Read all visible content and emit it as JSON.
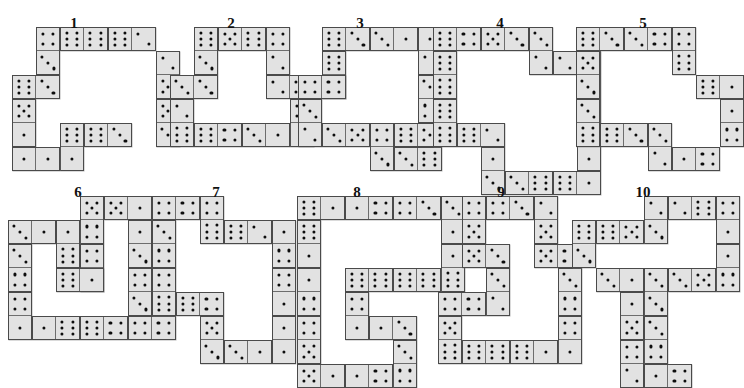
{
  "page": {
    "background_color": "#ffffff",
    "tile_color": "#e2e2e2",
    "tile_border_color": "#4a4a4a",
    "pip_color": "#0d0d0d",
    "label_color": "#111111"
  },
  "geometry": {
    "cell": 24,
    "tile_inset": 1,
    "note": "each domino occupies two adjacent grid cells of 24px"
  },
  "puzzles": [
    {
      "label": "1",
      "origin": [
        12,
        27
      ],
      "label_pos": [
        74,
        16
      ],
      "dominoes": [
        {
          "name": "d1",
          "col": 1,
          "row": 0,
          "orient": "v",
          "a": 4,
          "b": 3
        },
        {
          "name": "d2",
          "col": 2,
          "row": 0,
          "orient": "h",
          "a": 6,
          "b": 6
        },
        {
          "name": "d3",
          "col": 4,
          "row": 0,
          "orient": "h",
          "a": 6,
          "b": 2
        },
        {
          "name": "d4",
          "col": 6,
          "row": 1,
          "orient": "v",
          "a": 2,
          "b": 5
        },
        {
          "name": "d5",
          "col": 0,
          "row": 2,
          "orient": "h",
          "a": 6,
          "b": 3
        },
        {
          "name": "d6",
          "col": 0,
          "row": 3,
          "orient": "v",
          "a": 5,
          "b": 1
        },
        {
          "name": "d7",
          "col": 6,
          "row": 3,
          "orient": "v",
          "a": 5,
          "b": 3
        },
        {
          "name": "d8",
          "col": 2,
          "row": 4,
          "orient": "v",
          "a": 6,
          "b": 1
        },
        {
          "name": "d9",
          "col": 3,
          "row": 4,
          "orient": "h",
          "a": 6,
          "b": 3
        },
        {
          "name": "d10",
          "col": 0,
          "row": 5,
          "orient": "h",
          "a": 1,
          "b": 1
        }
      ]
    },
    {
      "label": "2",
      "origin": [
        170,
        27
      ],
      "label_pos": [
        231,
        16
      ],
      "dominoes": [
        {
          "name": "d1",
          "col": 1,
          "row": 0,
          "orient": "v",
          "a": 6,
          "b": 3
        },
        {
          "name": "d2",
          "col": 2,
          "row": 0,
          "orient": "h",
          "a": 5,
          "b": 6
        },
        {
          "name": "d3",
          "col": 4,
          "row": 0,
          "orient": "v",
          "a": 4,
          "b": 2
        },
        {
          "name": "d4",
          "col": 0,
          "row": 2,
          "orient": "h",
          "a": 3,
          "b": 3
        },
        {
          "name": "d5",
          "col": 4,
          "row": 2,
          "orient": "h",
          "a": 2,
          "b": 5
        },
        {
          "name": "d6",
          "col": 0,
          "row": 3,
          "orient": "v",
          "a": 2,
          "b": 6
        },
        {
          "name": "d7",
          "col": 5,
          "row": 3,
          "orient": "v",
          "a": 5,
          "b": 1
        },
        {
          "name": "d8",
          "col": 1,
          "row": 4,
          "orient": "h",
          "a": 6,
          "b": 4
        },
        {
          "name": "d9",
          "col": 3,
          "row": 4,
          "orient": "h",
          "a": 3,
          "b": 1
        }
      ]
    },
    {
      "label": "3",
      "origin": [
        298,
        27
      ],
      "label_pos": [
        360,
        16
      ],
      "dominoes": [
        {
          "name": "d1",
          "col": 1,
          "row": 0,
          "orient": "h",
          "a": 6,
          "b": 3
        },
        {
          "name": "d2",
          "col": 3,
          "row": 0,
          "orient": "h",
          "a": 3,
          "b": 1
        },
        {
          "name": "d3",
          "col": 5,
          "row": 0,
          "orient": "v",
          "a": 1,
          "b": 2
        },
        {
          "name": "d4",
          "col": 1,
          "row": 1,
          "orient": "v",
          "a": 6,
          "b": 4
        },
        {
          "name": "d5",
          "col": 0,
          "row": 2,
          "orient": "h",
          "a": 4,
          "b": 4
        },
        {
          "name": "d6",
          "col": 5,
          "row": 2,
          "orient": "v",
          "a": 3,
          "b": 4
        },
        {
          "name": "d7",
          "col": 0,
          "row": 3,
          "orient": "v",
          "a": 3,
          "b": 2
        },
        {
          "name": "d8",
          "col": 1,
          "row": 4,
          "orient": "h",
          "a": 3,
          "b": 5
        },
        {
          "name": "d9",
          "col": 3,
          "row": 4,
          "orient": "v",
          "a": 4,
          "b": 3
        },
        {
          "name": "d10",
          "col": 4,
          "row": 4,
          "orient": "h",
          "a": 6,
          "b": 5
        },
        {
          "name": "d11",
          "col": 4,
          "row": 5,
          "orient": "h",
          "a": 3,
          "b": 6
        }
      ]
    },
    {
      "label": "4",
      "origin": [
        433,
        27
      ],
      "label_pos": [
        500,
        16
      ],
      "dominoes": [
        {
          "name": "d1",
          "col": 0,
          "row": 0,
          "orient": "h",
          "a": 6,
          "b": 4
        },
        {
          "name": "d2",
          "col": 2,
          "row": 0,
          "orient": "h",
          "a": 5,
          "b": 3
        },
        {
          "name": "d3",
          "col": 4,
          "row": 0,
          "orient": "v",
          "a": 3,
          "b": 2
        },
        {
          "name": "d4",
          "col": 5,
          "row": 1,
          "orient": "h",
          "a": 2,
          "b": 5
        },
        {
          "name": "d5",
          "col": 0,
          "row": 1,
          "orient": "v",
          "a": 6,
          "b": 6
        },
        {
          "name": "d6",
          "col": 6,
          "row": 2,
          "orient": "v",
          "a": 4,
          "b": 1
        },
        {
          "name": "d7",
          "col": 0,
          "row": 3,
          "orient": "v",
          "a": 6,
          "b": 6
        },
        {
          "name": "d8",
          "col": 1,
          "row": 4,
          "orient": "h",
          "a": 6,
          "b": 2
        },
        {
          "name": "d9",
          "col": 6,
          "row": 4,
          "orient": "v",
          "a": 1,
          "b": 1
        },
        {
          "name": "d10",
          "col": 2,
          "row": 5,
          "orient": "v",
          "a": 1,
          "b": 3
        },
        {
          "name": "d11",
          "col": 3,
          "row": 6,
          "orient": "h",
          "a": 3,
          "b": 6
        },
        {
          "name": "d12",
          "col": 5,
          "row": 6,
          "orient": "h",
          "a": 6,
          "b": 1
        }
      ]
    },
    {
      "label": "5",
      "origin": [
        576,
        27
      ],
      "label_pos": [
        643,
        16
      ],
      "dominoes": [
        {
          "name": "d1",
          "col": 0,
          "row": 0,
          "orient": "h",
          "a": 6,
          "b": 3
        },
        {
          "name": "d2",
          "col": 2,
          "row": 0,
          "orient": "h",
          "a": 3,
          "b": 4
        },
        {
          "name": "d3",
          "col": 4,
          "row": 0,
          "orient": "v",
          "a": 4,
          "b": 6
        },
        {
          "name": "d4",
          "col": 0,
          "row": 1,
          "orient": "v",
          "a": 5,
          "b": 3
        },
        {
          "name": "d5",
          "col": 5,
          "row": 2,
          "orient": "h",
          "a": 6,
          "b": 1
        },
        {
          "name": "d6",
          "col": 0,
          "row": 3,
          "orient": "v",
          "a": 3,
          "b": 6
        },
        {
          "name": "d7",
          "col": 6,
          "row": 3,
          "orient": "v",
          "a": 1,
          "b": 4
        },
        {
          "name": "d8",
          "col": 1,
          "row": 4,
          "orient": "h",
          "a": 6,
          "b": 3
        },
        {
          "name": "d9",
          "col": 3,
          "row": 4,
          "orient": "v",
          "a": 3,
          "b": 2
        },
        {
          "name": "d10",
          "col": 4,
          "row": 5,
          "orient": "h",
          "a": 1,
          "b": 4
        }
      ]
    },
    {
      "label": "6",
      "origin": [
        8,
        196
      ],
      "label_pos": [
        78,
        185
      ],
      "dominoes": [
        {
          "name": "d1",
          "col": 3,
          "row": 0,
          "orient": "v",
          "a": 5,
          "b": 4
        },
        {
          "name": "d2",
          "col": 4,
          "row": 0,
          "orient": "h",
          "a": 5,
          "b": 1
        },
        {
          "name": "d3",
          "col": 0,
          "row": 1,
          "orient": "h",
          "a": 3,
          "b": 1
        },
        {
          "name": "d4",
          "col": 2,
          "row": 1,
          "orient": "v",
          "a": 1,
          "b": 6
        },
        {
          "name": "d5",
          "col": 5,
          "row": 1,
          "orient": "v",
          "a": 1,
          "b": 3
        },
        {
          "name": "d6",
          "col": 0,
          "row": 2,
          "orient": "v",
          "a": 3,
          "b": 4
        },
        {
          "name": "d7",
          "col": 3,
          "row": 2,
          "orient": "v",
          "a": 4,
          "b": 3
        },
        {
          "name": "d8",
          "col": 5,
          "row": 3,
          "orient": "v",
          "a": 4,
          "b": 3
        },
        {
          "name": "d9",
          "col": 2,
          "row": 3,
          "orient": "h",
          "a": 6,
          "b": 1
        },
        {
          "name": "d10",
          "col": 0,
          "row": 4,
          "orient": "v",
          "a": 4,
          "b": 1
        },
        {
          "name": "d11",
          "col": 1,
          "row": 5,
          "orient": "h",
          "a": 1,
          "b": 6
        },
        {
          "name": "d12",
          "col": 3,
          "row": 5,
          "orient": "h",
          "a": 6,
          "b": 4
        },
        {
          "name": "d13",
          "col": 5,
          "row": 5,
          "orient": "h",
          "a": 4,
          "b": 4
        }
      ]
    },
    {
      "label": "7",
      "origin": [
        152,
        196
      ],
      "label_pos": [
        216,
        185
      ],
      "dominoes": [
        {
          "name": "d1",
          "col": 0,
          "row": 0,
          "orient": "h",
          "a": 4,
          "b": 4
        },
        {
          "name": "d2",
          "col": 2,
          "row": 0,
          "orient": "v",
          "a": 4,
          "b": 6
        },
        {
          "name": "d3",
          "col": 3,
          "row": 1,
          "orient": "h",
          "a": 6,
          "b": 2
        },
        {
          "name": "d4",
          "col": 5,
          "row": 1,
          "orient": "v",
          "a": 1,
          "b": 4
        },
        {
          "name": "d5",
          "col": 0,
          "row": 1,
          "orient": "v",
          "a": 3,
          "b": 4
        },
        {
          "name": "d6",
          "col": 0,
          "row": 3,
          "orient": "v",
          "a": 4,
          "b": 6
        },
        {
          "name": "d7",
          "col": 1,
          "row": 4,
          "orient": "h",
          "a": 6,
          "b": 4
        },
        {
          "name": "d8",
          "col": 5,
          "row": 3,
          "orient": "v",
          "a": 4,
          "b": 1
        },
        {
          "name": "d9",
          "col": 2,
          "row": 5,
          "orient": "v",
          "a": 5,
          "b": 3
        },
        {
          "name": "d10",
          "col": 3,
          "row": 6,
          "orient": "h",
          "a": 3,
          "b": 1
        },
        {
          "name": "d11",
          "col": 5,
          "row": 5,
          "orient": "v",
          "a": 1,
          "b": 1
        }
      ]
    },
    {
      "label": "8",
      "origin": [
        297,
        196
      ],
      "label_pos": [
        357,
        185
      ],
      "dominoes": [
        {
          "name": "d1",
          "col": 0,
          "row": 0,
          "orient": "h",
          "a": 6,
          "b": 1
        },
        {
          "name": "d2",
          "col": 2,
          "row": 0,
          "orient": "h",
          "a": 1,
          "b": 4
        },
        {
          "name": "d3",
          "col": 4,
          "row": 0,
          "orient": "h",
          "a": 4,
          "b": 3
        },
        {
          "name": "d4",
          "col": 6,
          "row": 0,
          "orient": "v",
          "a": 3,
          "b": 1
        },
        {
          "name": "d5",
          "col": 0,
          "row": 1,
          "orient": "v",
          "a": 6,
          "b": 1
        },
        {
          "name": "d6",
          "col": 6,
          "row": 2,
          "orient": "v",
          "a": 1,
          "b": 6
        },
        {
          "name": "d7",
          "col": 0,
          "row": 3,
          "orient": "v",
          "a": 1,
          "b": 4
        },
        {
          "name": "d8",
          "col": 2,
          "row": 3,
          "orient": "h",
          "a": 6,
          "b": 6
        },
        {
          "name": "d9",
          "col": 4,
          "row": 3,
          "orient": "h",
          "a": 6,
          "b": 6
        },
        {
          "name": "d10",
          "col": 2,
          "row": 4,
          "orient": "v",
          "a": 4,
          "b": 1
        },
        {
          "name": "d11",
          "col": 0,
          "row": 5,
          "orient": "v",
          "a": 4,
          "b": 5
        },
        {
          "name": "d12",
          "col": 3,
          "row": 5,
          "orient": "h",
          "a": 1,
          "b": 3
        },
        {
          "name": "d13",
          "col": 4,
          "row": 6,
          "orient": "v",
          "a": 3,
          "b": 4
        },
        {
          "name": "d14",
          "col": 0,
          "row": 7,
          "orient": "h",
          "a": 5,
          "b": 1
        },
        {
          "name": "d15",
          "col": 2,
          "row": 7,
          "orient": "h",
          "a": 1,
          "b": 4
        }
      ]
    },
    {
      "label": "9",
      "origin": [
        438,
        196
      ],
      "label_pos": [
        501,
        185
      ],
      "dominoes": [
        {
          "name": "d1",
          "col": 1,
          "row": 0,
          "orient": "v",
          "a": 4,
          "b": 5
        },
        {
          "name": "d2",
          "col": 2,
          "row": 0,
          "orient": "h",
          "a": 4,
          "b": 3
        },
        {
          "name": "d3",
          "col": 4,
          "row": 0,
          "orient": "v",
          "a": 2,
          "b": 5
        },
        {
          "name": "d4",
          "col": 1,
          "row": 2,
          "orient": "h",
          "a": 5,
          "b": 3
        },
        {
          "name": "d5",
          "col": 4,
          "row": 2,
          "orient": "h",
          "a": 5,
          "b": 4
        },
        {
          "name": "d6",
          "col": 2,
          "row": 3,
          "orient": "v",
          "a": 3,
          "b": 2
        },
        {
          "name": "d7",
          "col": 5,
          "row": 3,
          "orient": "v",
          "a": 3,
          "b": 4
        },
        {
          "name": "d8",
          "col": 0,
          "row": 4,
          "orient": "h",
          "a": 4,
          "b": 4
        },
        {
          "name": "d9",
          "col": 0,
          "row": 5,
          "orient": "v",
          "a": 5,
          "b": 6
        },
        {
          "name": "d10",
          "col": 5,
          "row": 5,
          "orient": "v",
          "a": 4,
          "b": 1
        },
        {
          "name": "d11",
          "col": 1,
          "row": 6,
          "orient": "h",
          "a": 6,
          "b": 6
        },
        {
          "name": "d12",
          "col": 3,
          "row": 6,
          "orient": "h",
          "a": 6,
          "b": 1
        }
      ]
    },
    {
      "label": "10",
      "origin": [
        572,
        196
      ],
      "label_pos": [
        643,
        185
      ],
      "dominoes": [
        {
          "name": "d1",
          "col": 3,
          "row": 0,
          "orient": "v",
          "a": 2,
          "b": 3
        },
        {
          "name": "d2",
          "col": 4,
          "row": 0,
          "orient": "h",
          "a": 2,
          "b": 6
        },
        {
          "name": "d3",
          "col": 6,
          "row": 0,
          "orient": "v",
          "a": 4,
          "b": 1
        },
        {
          "name": "d4",
          "col": 0,
          "row": 1,
          "orient": "v",
          "a": 6,
          "b": 3
        },
        {
          "name": "d5",
          "col": 1,
          "row": 1,
          "orient": "h",
          "a": 6,
          "b": 5
        },
        {
          "name": "d6",
          "col": 6,
          "row": 2,
          "orient": "v",
          "a": 1,
          "b": 4
        },
        {
          "name": "d7",
          "col": 1,
          "row": 3,
          "orient": "h",
          "a": 3,
          "b": 1
        },
        {
          "name": "d8",
          "col": 3,
          "row": 3,
          "orient": "v",
          "a": 3,
          "b": 3
        },
        {
          "name": "d9",
          "col": 4,
          "row": 3,
          "orient": "h",
          "a": 3,
          "b": 5
        },
        {
          "name": "d10",
          "col": 2,
          "row": 4,
          "orient": "v",
          "a": 1,
          "b": 5
        },
        {
          "name": "d11",
          "col": 3,
          "row": 5,
          "orient": "v",
          "a": 3,
          "b": 4
        },
        {
          "name": "d12",
          "col": 2,
          "row": 6,
          "orient": "v",
          "a": 4,
          "b": 2
        },
        {
          "name": "d13",
          "col": 3,
          "row": 7,
          "orient": "h",
          "a": 1,
          "b": 4
        }
      ]
    }
  ]
}
